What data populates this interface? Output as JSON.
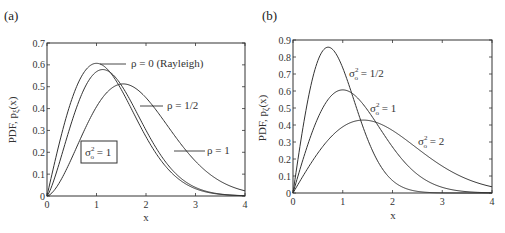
{
  "chart_data": [
    {
      "panel": "(a)",
      "type": "line",
      "xlabel": "x",
      "ylabel": "PDF, p",
      "ylabel_sub": "ξ",
      "ylabel_suffix": "(x)",
      "xlim": [
        0,
        4
      ],
      "ylim": [
        0,
        0.7
      ],
      "xticks": [
        0,
        1,
        2,
        3,
        4
      ],
      "xtick_labels": [
        "0",
        "1",
        "2",
        "3",
        "4"
      ],
      "yticks": [
        0,
        0.1,
        0.2,
        0.3,
        0.4,
        0.5,
        0.6,
        0.7
      ],
      "ytick_labels": [
        "0",
        "0.1",
        "0.2",
        "0.3",
        "0.4",
        "0.5",
        "0.6",
        "0.7"
      ],
      "grid": false,
      "boxed_annotation": {
        "symbol": "σ",
        "sub": "o",
        "sup": "2",
        "text": " = 1"
      },
      "series": [
        {
          "name": "ρ = 0 (Rayleigh)",
          "rho": 0,
          "peak_x": 1.0,
          "peak_y": 0.607
        },
        {
          "name": "ρ = 1/2",
          "rho": 0.5,
          "peak_x": 1.05,
          "peak_y": 0.575
        },
        {
          "name": "ρ = 1",
          "rho": 1,
          "peak_x": 1.35,
          "peak_y": 0.5
        }
      ],
      "labels": [
        "ρ = 0 (Rayleigh)",
        "ρ = 1/2",
        "ρ = 1"
      ]
    },
    {
      "panel": "(b)",
      "type": "line",
      "xlabel": "x",
      "ylabel": "PDF, p",
      "ylabel_sub": "ζ",
      "ylabel_suffix": "(x)",
      "xlim": [
        0,
        4
      ],
      "ylim": [
        0,
        0.9
      ],
      "xticks": [
        0,
        1,
        2,
        3,
        4
      ],
      "xtick_labels": [
        "0",
        "1",
        "2",
        "3",
        "4"
      ],
      "yticks": [
        0,
        0.1,
        0.2,
        0.3,
        0.4,
        0.5,
        0.6,
        0.7,
        0.8,
        0.9
      ],
      "ytick_labels": [
        "0",
        "0.1",
        "0.2",
        "0.3",
        "0.4",
        "0.5",
        "0.6",
        "0.7",
        "0.8",
        "0.9"
      ],
      "grid": false,
      "series": [
        {
          "name": "σo² = 1/2",
          "sigma2": 0.5,
          "peak_x": 0.71,
          "peak_y": 0.858
        },
        {
          "name": "σo² = 1",
          "sigma2": 1,
          "peak_x": 1.0,
          "peak_y": 0.607
        },
        {
          "name": "σo² = 2",
          "sigma2": 2,
          "peak_x": 1.41,
          "peak_y": 0.429
        }
      ],
      "labels": [
        {
          "symbol": "σ",
          "sub": "o",
          "sup": "2",
          "text": " = 1/2"
        },
        {
          "symbol": "σ",
          "sub": "o",
          "sup": "2",
          "text": " = 1"
        },
        {
          "symbol": "σ",
          "sub": "o",
          "sup": "2",
          "text": " = 2"
        }
      ]
    }
  ]
}
